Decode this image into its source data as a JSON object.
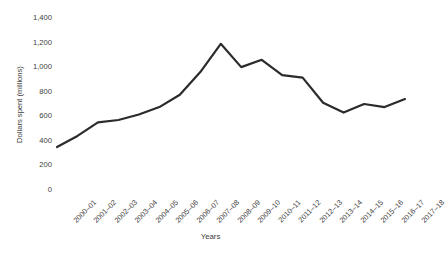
{
  "chart_data": {
    "type": "line",
    "title": "",
    "xlabel": "Years",
    "ylabel": "Dollars spent (millions)",
    "ylim": [
      0,
      1400
    ],
    "yticks": [
      "0",
      "200",
      "400",
      "600",
      "800",
      "1,000",
      "1,200",
      "1,400"
    ],
    "ytick_values": [
      0,
      200,
      400,
      600,
      800,
      1000,
      1200,
      1400
    ],
    "grid": false,
    "legend": false,
    "line_color": "#2b2b2b",
    "line_width": 2.2,
    "categories": [
      "2000–01",
      "2001–02",
      "2002–03",
      "2003–04",
      "2004–05",
      "2005–06",
      "2006–07",
      "2007–08",
      "2008–09",
      "2009–10",
      "2010–11",
      "2011–12",
      "2012–13",
      "2013–14",
      "2014–15",
      "2015–16",
      "2016–17",
      "2017–18"
    ],
    "values": [
      350,
      440,
      550,
      570,
      615,
      675,
      775,
      960,
      1190,
      1000,
      1060,
      935,
      915,
      710,
      630,
      700,
      675,
      740
    ],
    "series": [
      {
        "name": "Dollars spent (millions)",
        "values": [
          350,
          440,
          550,
          570,
          615,
          675,
          775,
          960,
          1190,
          1000,
          1060,
          935,
          915,
          710,
          630,
          700,
          675,
          740
        ]
      }
    ]
  }
}
